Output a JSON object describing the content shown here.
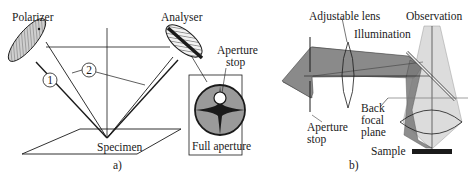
{
  "panel_a": {
    "caption": "a)",
    "labels": {
      "polarizer": "Polarizer",
      "analyser": "Analyser",
      "specimen": "Specimen",
      "aperture_stop": "Aperture",
      "aperture_stop_2": "stop",
      "full_aperture": "Full aperture",
      "ray_1": "1",
      "ray_2": "2"
    }
  },
  "panel_b": {
    "caption": "b)",
    "labels": {
      "adjustable_lens": "Adjustable lens",
      "illumination": "Illumination",
      "observation": "Observation",
      "back": "Back",
      "focal": "focal",
      "plane": "plane",
      "aperture": "Aperture",
      "stop": "stop",
      "sample": "Sample"
    }
  },
  "colors": {
    "line": "#1a1a1a",
    "dark_fill": "#2a2a2a",
    "gray_fill": "#8a8a8a",
    "light_fill": "#c8c8c8",
    "lighter_fill": "#dedede",
    "background": "#ffffff"
  }
}
